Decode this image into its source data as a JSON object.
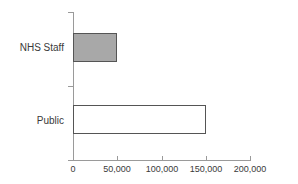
{
  "chart_data": {
    "type": "bar",
    "orientation": "horizontal",
    "title": "",
    "subtitle": "",
    "xlabel": "",
    "ylabel": "",
    "categories": [
      "NHS Staff",
      "Public"
    ],
    "values": [
      50000,
      150000
    ],
    "xlim": [
      0,
      200000
    ],
    "xticks": [
      0,
      50000,
      100000,
      150000,
      200000
    ],
    "xtick_labels": [
      "0",
      "50,000",
      "100,000",
      "150,000",
      "200,000"
    ],
    "grid": false,
    "legend": false,
    "legend_position": "none",
    "annotations": [],
    "series": [
      {
        "name": "",
        "values": [
          50000,
          150000
        ],
        "bar_styles": [
          {
            "category": "NHS Staff",
            "fill": "#a8a8a8",
            "border": "#555555"
          },
          {
            "category": "Public",
            "fill": "#ffffff",
            "border": "#555555"
          }
        ]
      }
    ],
    "colors": {
      "nhs_staff_fill": "#a8a8a8",
      "public_fill": "#ffffff",
      "bar_border": "#555555",
      "axis": "#9a9a9a",
      "text": "#3a3a3a",
      "background": "#ffffff"
    }
  }
}
